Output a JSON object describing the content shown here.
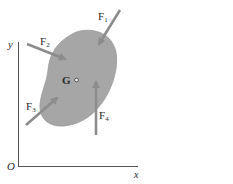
{
  "figure": {
    "type": "rigid-body-force-diagram",
    "axes": {
      "x_label": "x",
      "y_label": "y",
      "origin_label": "O"
    },
    "body": {
      "center_label": "G",
      "fill_color": "#a6a6a6"
    },
    "forces": [
      {
        "name": "F",
        "subscript": "1"
      },
      {
        "name": "F",
        "subscript": "2"
      },
      {
        "name": "F",
        "subscript": "3"
      },
      {
        "name": "F",
        "subscript": "4"
      }
    ],
    "arrow_color": "#8c8c8c"
  }
}
